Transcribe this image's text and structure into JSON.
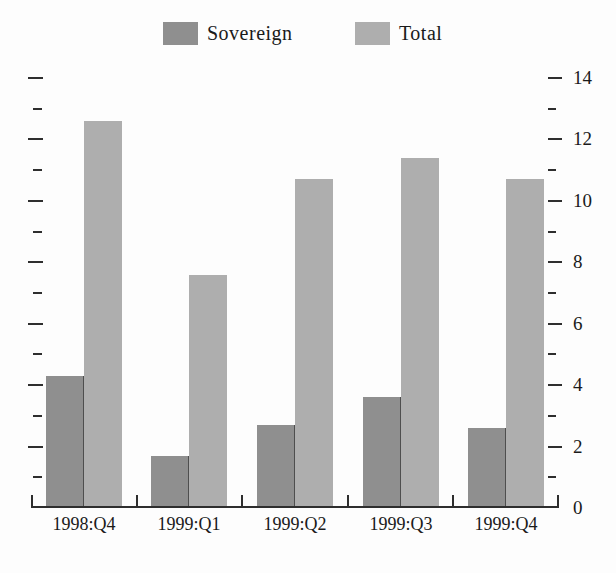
{
  "colors": {
    "background": "#fdfdfd",
    "axis": "#2e2e2e",
    "text": "#1a1a1a",
    "bar_divider": "#4e4e4e"
  },
  "chart_data": {
    "type": "bar",
    "categories": [
      "1998:Q4",
      "1999:Q1",
      "1999:Q2",
      "1999:Q3",
      "1999:Q4"
    ],
    "series": [
      {
        "name": "Sovereign",
        "color": "#8f8f8f",
        "values": [
          4.3,
          1.7,
          2.7,
          3.6,
          2.6
        ]
      },
      {
        "name": "Total",
        "color": "#aeaeae",
        "values": [
          12.6,
          7.6,
          10.7,
          11.4,
          10.7
        ]
      }
    ],
    "y_axis": {
      "labels_side": "right",
      "range": [
        0,
        14
      ],
      "major_ticks": [
        0,
        2,
        4,
        6,
        8,
        10,
        12,
        14
      ],
      "minor_ticks": [
        1,
        3,
        5,
        7,
        9,
        11,
        13
      ],
      "mirrored_unlabeled_left_ticks": true
    },
    "legend_position": "top",
    "grid": false
  }
}
